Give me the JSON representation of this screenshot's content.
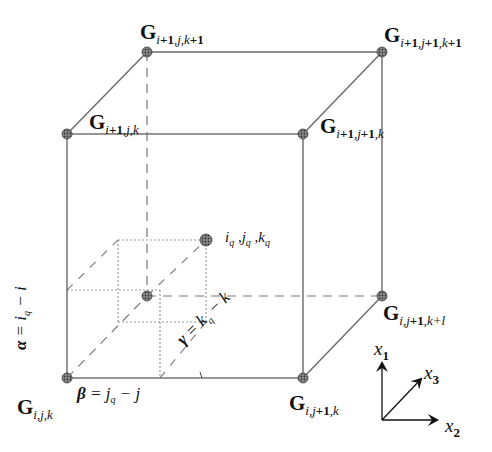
{
  "figure": {
    "type": "trilinear-interpolation-cell",
    "colors": {
      "edge": "#6a6a6a",
      "node_fill": "#555555",
      "hidden": "#777777",
      "text": "#111111"
    },
    "nodes": [
      {
        "id": "G_i_j_k",
        "label_main": "G",
        "label_sub": "i,j,k",
        "x": 67,
        "y": 378
      },
      {
        "id": "G_i_j1_k",
        "label_main": "G",
        "label_sub": "i,j+1,k",
        "x": 303,
        "y": 378
      },
      {
        "id": "G_i1_j_k",
        "label_main": "G",
        "label_sub": "i+1,j,k",
        "x": 67,
        "y": 134
      },
      {
        "id": "G_i1_j1_k",
        "label_main": "G",
        "label_sub": "i+1,j+1,k",
        "x": 303,
        "y": 134
      },
      {
        "id": "G_i1_j_k1",
        "label_main": "G",
        "label_sub": "i+1,j,k+1",
        "x": 147,
        "y": 52
      },
      {
        "id": "G_i1_j1_k1",
        "label_main": "G",
        "label_sub": "i+1,j+1,k+1",
        "x": 382,
        "y": 52
      },
      {
        "id": "G_i_j1_k1",
        "label_main": "G",
        "label_sub": "i,j+1,k+1",
        "x": 382,
        "y": 296
      }
    ],
    "query_point": {
      "label": "i_q ,j_q ,k_q",
      "x": 206,
      "y": 240
    },
    "annotations": {
      "alpha": "α = i_q − i",
      "beta": "β = j_q − j",
      "gamma": "γ = k_q − k"
    },
    "axes": {
      "x1": "x1",
      "x2": "x2",
      "x3": "x3"
    }
  },
  "labels": {
    "G_i1_j_k1": {
      "main": "G",
      "sub_parts": [
        "i",
        "+1",
        ",",
        "j",
        ",",
        "k",
        "+1"
      ]
    },
    "G_i1_j1_k1": {
      "main": "G",
      "sub_parts": [
        "i",
        "+1",
        ",",
        "j",
        "+1",
        ",",
        "k",
        "+1"
      ]
    },
    "G_i1_j_k": {
      "main": "G",
      "sub_parts": [
        "i",
        "+1",
        ",",
        "j",
        ",",
        "k"
      ]
    },
    "G_i1_j1_k": {
      "main": "G",
      "sub_parts": [
        "i",
        "+1",
        ",",
        "j",
        "+1",
        ",",
        "k"
      ]
    },
    "G_i_j1_k1": {
      "main": "G",
      "sub_parts": [
        "i",
        ",",
        "j",
        "+1",
        ",",
        "k",
        "+",
        "l"
      ]
    },
    "G_i_j_k": {
      "main": "G",
      "sub_parts": [
        "i",
        ",",
        "j",
        ",",
        "k"
      ]
    },
    "G_i_j1_k": {
      "main": "G",
      "sub_parts": [
        "i",
        ",",
        "j",
        "+1",
        ",",
        "k"
      ]
    },
    "query": {
      "i": "i",
      "j": "j",
      "k": "k",
      "q": "q",
      "sep": " ,"
    },
    "alpha": {
      "sym": "α",
      "eq": " = ",
      "var": "i",
      "sub": "q",
      "rest": " − i"
    },
    "beta": {
      "sym": "β",
      "eq": " = ",
      "var": "j",
      "sub": "q",
      "rest": " − j"
    },
    "gamma": {
      "sym": "γ",
      "eq": " = ",
      "var": "k",
      "sub": "q",
      "rest": " − k"
    },
    "x1": {
      "var": "x",
      "sub": "1"
    },
    "x2": {
      "var": "x",
      "sub": "2"
    },
    "x3": {
      "var": "x",
      "sub": "3"
    }
  }
}
